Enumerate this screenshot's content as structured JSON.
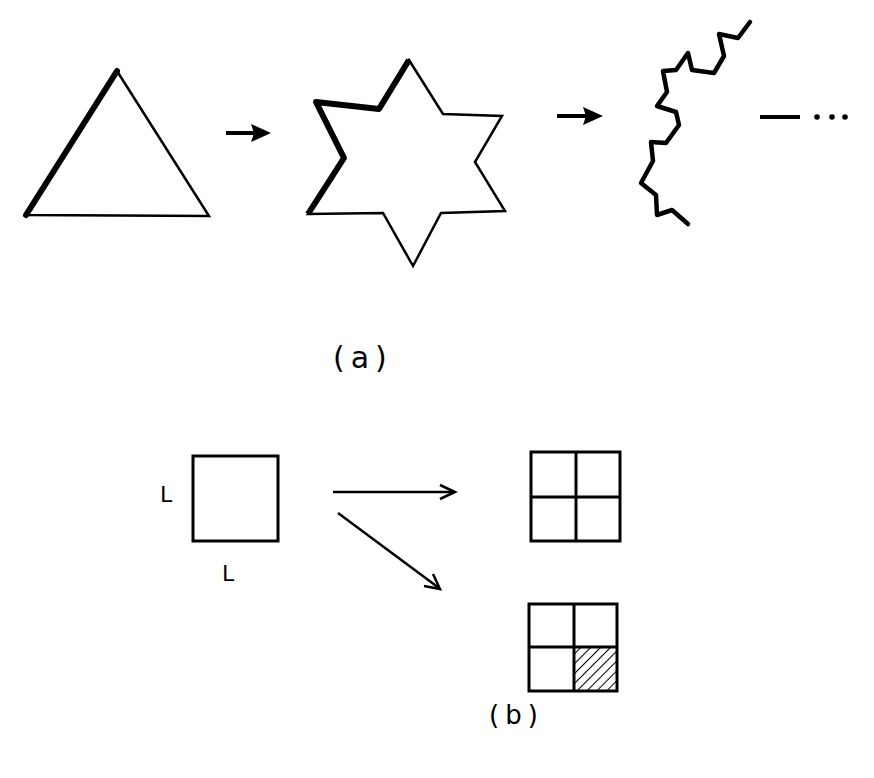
{
  "panel_a": {
    "label": "(a)",
    "stages": [
      {
        "name": "triangle",
        "description": "Equilateral triangle, left edge emphasized (bold)"
      },
      {
        "name": "star",
        "description": "Six-pointed star (Koch iteration 1), left segments emphasized"
      },
      {
        "name": "koch-curve",
        "description": "Jagged Koch curve segment (higher iteration)"
      }
    ],
    "continuation": "—  . . ."
  },
  "panel_b": {
    "label": "(b)",
    "square_side_label_left": "L",
    "square_side_label_bottom": "L",
    "outcomes": [
      {
        "name": "2x2-grid",
        "description": "Square divided into 4 equal subsquares"
      },
      {
        "name": "2x2-grid-hatched",
        "description": "Square divided into 4 subsquares, bottom-right hatched"
      }
    ]
  },
  "colors": {
    "ink": "#000000",
    "background": "#ffffff"
  }
}
